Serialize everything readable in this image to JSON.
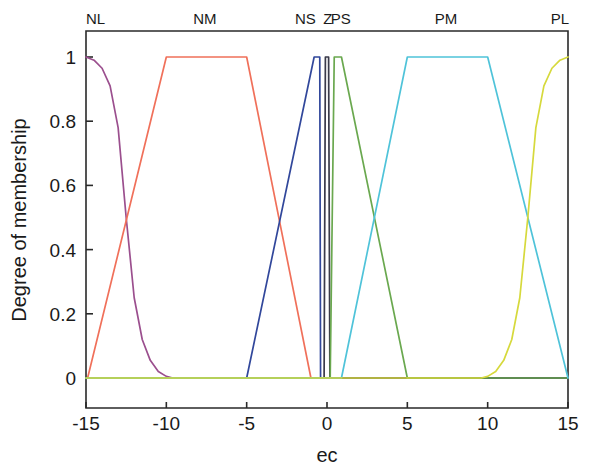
{
  "figure": {
    "background_color": "#ffffff",
    "axis_color": "#2a2a2a"
  },
  "chart_data": {
    "type": "line",
    "title": "",
    "xlabel": "ec",
    "ylabel": "Degree of membership",
    "xlim": [
      -15,
      15
    ],
    "ylim": [
      -0.06,
      1.06
    ],
    "xticks": [
      -15,
      -10,
      -5,
      0,
      5,
      10,
      15
    ],
    "xticklabels": [
      "-15",
      "-10",
      "-5",
      "0",
      "5",
      "10",
      "15"
    ],
    "yticks": [
      0,
      0.2,
      0.4,
      0.6,
      0.8,
      1
    ],
    "yticklabels": [
      "0",
      "0.2",
      "0.4",
      "0.6",
      "0.8",
      "1"
    ],
    "grid": false,
    "legend": "none",
    "annotations": [
      {
        "text": "NL",
        "x": -14.4,
        "y": 1.12
      },
      {
        "text": "NM",
        "x": -7.6,
        "y": 1.12
      },
      {
        "text": "NS",
        "x": -1.35,
        "y": 1.12
      },
      {
        "text": "Z",
        "x": 0.05,
        "y": 1.12
      },
      {
        "text": "PS",
        "x": 0.85,
        "y": 1.12
      },
      {
        "text": "PM",
        "x": 7.4,
        "y": 1.12
      },
      {
        "text": "PL",
        "x": 14.5,
        "y": 1.12
      }
    ],
    "series": [
      {
        "name": "NL",
        "color": "#9b4f8e",
        "shape": "sigmoid-decreasing",
        "x": [
          -15,
          -14.5,
          -14,
          -13.5,
          -13,
          -12.5,
          -12,
          -11.5,
          -11,
          -10.5,
          -10,
          -9.6,
          -9.2,
          15
        ],
        "values": [
          1.0,
          0.99,
          0.965,
          0.91,
          0.78,
          0.5,
          0.25,
          0.12,
          0.055,
          0.02,
          0.005,
          0.0,
          0.0,
          0.0
        ]
      },
      {
        "name": "NM",
        "color": "#f0705a",
        "shape": "trapezoid",
        "x": [
          -15,
          -14.9,
          -10,
          -5,
          -1,
          15
        ],
        "values": [
          0.0,
          0.0,
          1.0,
          1.0,
          0.0,
          0.0
        ]
      },
      {
        "name": "NS",
        "color": "#31479b",
        "shape": "trapezoid",
        "x": [
          -15,
          -5,
          -0.8,
          -0.45,
          -0.4,
          15
        ],
        "values": [
          0.0,
          0.0,
          1.0,
          1.0,
          0.0,
          0.0
        ]
      },
      {
        "name": "Z",
        "color": "#3a3a4a",
        "shape": "narrow-spike",
        "x": [
          -15,
          -0.18,
          -0.1,
          0.1,
          0.18,
          15
        ],
        "values": [
          0.0,
          0.0,
          1.0,
          1.0,
          0.0,
          0.0
        ]
      },
      {
        "name": "PS",
        "color": "#6aa84f",
        "shape": "trapezoid",
        "x": [
          -15,
          0.2,
          0.45,
          0.9,
          5,
          15
        ],
        "values": [
          0.0,
          0.0,
          1.0,
          1.0,
          0.0,
          0.0
        ]
      },
      {
        "name": "PM",
        "color": "#4fc3d9",
        "shape": "trapezoid",
        "x": [
          -15,
          0.9,
          5,
          10,
          15,
          15
        ],
        "values": [
          0.0,
          0.0,
          1.0,
          1.0,
          0.0,
          0.0
        ]
      },
      {
        "name": "PL",
        "color": "#d6d93c",
        "shape": "sigmoid-increasing",
        "x": [
          -15,
          9.2,
          9.6,
          10,
          10.5,
          11,
          11.5,
          12,
          12.5,
          13,
          13.5,
          14,
          14.5,
          15
        ],
        "values": [
          0.0,
          0.0,
          0.0,
          0.005,
          0.02,
          0.055,
          0.12,
          0.25,
          0.5,
          0.78,
          0.91,
          0.965,
          0.99,
          1.0
        ]
      }
    ]
  }
}
